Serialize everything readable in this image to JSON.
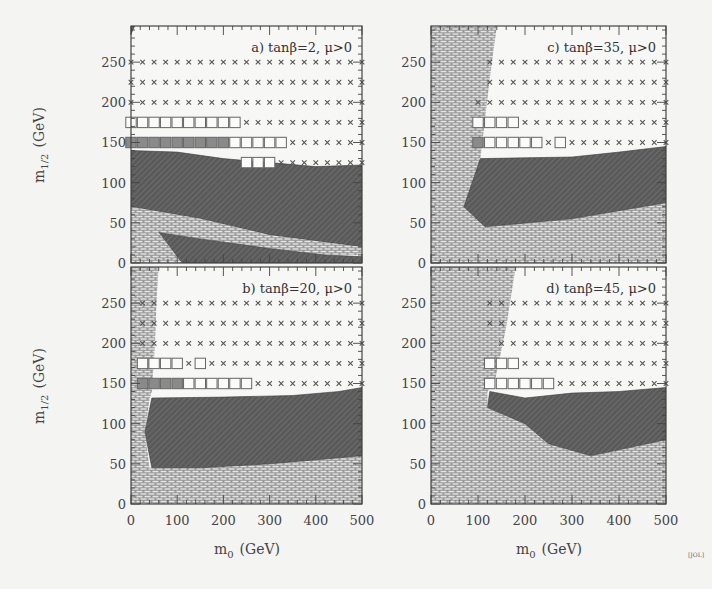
{
  "chart_data": [
    {
      "type": "scatter",
      "panel": "a",
      "title": "a) tanβ=2, μ>0",
      "xlabel": "m0 (GeV)",
      "ylabel": "m1/2 (GeV)",
      "xlim": [
        0,
        500
      ],
      "ylim": [
        0,
        295
      ],
      "xticks": [
        0,
        100,
        200,
        300,
        400,
        500
      ],
      "yticks": [
        0,
        50,
        100,
        150,
        200,
        250
      ],
      "grid_x_start": 0,
      "grid_dx": 25,
      "grid_cols": 21,
      "rows": [
        {
          "y": 250,
          "markers": "xxxxxxxxxxxxxxxxxxxxx"
        },
        {
          "y": 225,
          "markers": "xxxxxxxxxxxxxxxxxxxxx"
        },
        {
          "y": 200,
          "markers": "xxxxxxxxxxxxxxxxxxxxx"
        },
        {
          "y": 175,
          "markers": "ooooooooooxxxxxxxxxxx"
        },
        {
          "y": 150,
          "markers": "FFFFFFFFFoooooxxxxxxx"
        },
        {
          "y": 125,
          "markers": "..........oooxxxxxxxx"
        }
      ],
      "regions": [
        {
          "kind": "hatched",
          "points": [
            [
              0,
              140
            ],
            [
              100,
              138
            ],
            [
              200,
              130
            ],
            [
              300,
              125
            ],
            [
              400,
              120
            ],
            [
              500,
              122
            ],
            [
              500,
              20
            ],
            [
              300,
              35
            ],
            [
              150,
              55
            ],
            [
              0,
              70
            ]
          ]
        },
        {
          "kind": "brick",
          "points": [
            [
              0,
              70
            ],
            [
              150,
              55
            ],
            [
              300,
              35
            ],
            [
              500,
              20
            ],
            [
              500,
              10
            ],
            [
              420,
              10
            ],
            [
              300,
              18
            ],
            [
              150,
              30
            ],
            [
              60,
              38
            ],
            [
              30,
              30
            ],
            [
              30,
              0
            ],
            [
              0,
              0
            ]
          ]
        },
        {
          "kind": "hatched",
          "points": [
            [
              60,
              38
            ],
            [
              150,
              30
            ],
            [
              300,
              18
            ],
            [
              420,
              10
            ],
            [
              500,
              8
            ],
            [
              500,
              0
            ],
            [
              110,
              0
            ]
          ]
        },
        {
          "kind": "brick",
          "points": [
            [
              30,
              30
            ],
            [
              60,
              38
            ],
            [
              110,
              0
            ],
            [
              30,
              0
            ]
          ]
        },
        {
          "kind": "hatched",
          "points": [
            [
              0,
              295
            ],
            [
              8,
              295
            ],
            [
              0,
              285
            ]
          ]
        }
      ]
    },
    {
      "type": "scatter",
      "panel": "b",
      "title": "b) tanβ=20, μ>0",
      "xlabel": "m0 (GeV)",
      "ylabel": "m1/2 (GeV)",
      "xlim": [
        0,
        500
      ],
      "ylim": [
        0,
        295
      ],
      "xticks": [
        0,
        100,
        200,
        300,
        400,
        500
      ],
      "yticks": [
        0,
        50,
        100,
        150,
        200,
        250
      ],
      "grid_x_start": 25,
      "grid_dx": 25,
      "grid_cols": 20,
      "rows": [
        {
          "y": 250,
          "markers": "xxxxxxxxxxxxxxxxxxxx"
        },
        {
          "y": 225,
          "markers": "xxxxxxxxxxxxxxxxxxxx"
        },
        {
          "y": 200,
          "markers": "xxxxxxxxxxxxxxxxxxxx"
        },
        {
          "y": 175,
          "markers": "ooooxoxxxxxxxxxxxxxx"
        },
        {
          "y": 150,
          "markers": "FFFFooooooxxxxxxxxxx"
        }
      ],
      "regions": [
        {
          "kind": "brick",
          "points": [
            [
              0,
              0
            ],
            [
              0,
              295
            ],
            [
              60,
              295
            ],
            [
              55,
              250
            ],
            [
              52,
              200
            ],
            [
              45,
              140
            ],
            [
              40,
              130
            ],
            [
              30,
              90
            ],
            [
              40,
              45
            ],
            [
              500,
              60
            ],
            [
              500,
              0
            ]
          ]
        },
        {
          "kind": "hatched",
          "points": [
            [
              45,
              132
            ],
            [
              200,
              133
            ],
            [
              350,
              135
            ],
            [
              450,
              140
            ],
            [
              500,
              145
            ],
            [
              500,
              60
            ],
            [
              300,
              50
            ],
            [
              150,
              45
            ],
            [
              45,
              45
            ],
            [
              30,
              90
            ]
          ]
        }
      ]
    },
    {
      "type": "scatter",
      "panel": "c",
      "title": "c) tanβ=35, μ>0",
      "xlabel": "m0 (GeV)",
      "ylabel": "m1/2 (GeV)",
      "xlim": [
        0,
        500
      ],
      "ylim": [
        0,
        295
      ],
      "xticks": [
        0,
        100,
        200,
        300,
        400,
        500
      ],
      "yticks": [
        0,
        50,
        100,
        150,
        200,
        250
      ],
      "grid_x_start": 100,
      "grid_dx": 25,
      "grid_cols": 17,
      "rows": [
        {
          "y": 250,
          "markers": ".xxxxxxxxxxxxxxxx"
        },
        {
          "y": 225,
          "markers": ".xxxxxxxxxxxxxxxx"
        },
        {
          "y": 200,
          "markers": "xxxxxxxxxxxxxxxxx"
        },
        {
          "y": 175,
          "markers": "ooooxxxxxxxxxxxxx"
        },
        {
          "y": 150,
          "markers": "Foooooxoxxxxxxxxx"
        }
      ],
      "regions": [
        {
          "kind": "brick",
          "points": [
            [
              0,
              0
            ],
            [
              0,
              295
            ],
            [
              140,
              295
            ],
            [
              125,
              230
            ],
            [
              105,
              130
            ],
            [
              90,
              80
            ],
            [
              115,
              45
            ],
            [
              300,
              55
            ],
            [
              500,
              75
            ],
            [
              500,
              0
            ]
          ]
        },
        {
          "kind": "hatched",
          "points": [
            [
              105,
              130
            ],
            [
              300,
              132
            ],
            [
              400,
              138
            ],
            [
              500,
              145
            ],
            [
              500,
              75
            ],
            [
              300,
              55
            ],
            [
              115,
              45
            ],
            [
              70,
              70
            ]
          ]
        }
      ]
    },
    {
      "type": "scatter",
      "panel": "d",
      "title": "d) tanβ=45, μ>0",
      "xlabel": "m0 (GeV)",
      "ylabel": "m1/2 (GeV)",
      "xlim": [
        0,
        500
      ],
      "ylim": [
        0,
        295
      ],
      "xticks": [
        0,
        100,
        200,
        300,
        400,
        500
      ],
      "yticks": [
        0,
        50,
        100,
        150,
        200,
        250
      ],
      "grid_x_start": 125,
      "grid_dx": 25,
      "grid_cols": 16,
      "rows": [
        {
          "y": 250,
          "markers": "xxxxxxxxxxxxxxxx"
        },
        {
          "y": 225,
          "markers": "xxxxxxxxxxxxxxxx"
        },
        {
          "y": 200,
          "markers": ".xxxxxxxxxxxxxxx"
        },
        {
          "y": 175,
          "markers": "oooxxxxxxxxxxxxx"
        },
        {
          "y": 150,
          "markers": "ooooooxxxxxxxxxx"
        }
      ],
      "regions": [
        {
          "kind": "brick",
          "points": [
            [
              0,
              0
            ],
            [
              0,
              295
            ],
            [
              180,
              295
            ],
            [
              160,
              220
            ],
            [
              135,
              150
            ],
            [
              120,
              140
            ],
            [
              120,
              120
            ],
            [
              200,
              100
            ],
            [
              250,
              75
            ],
            [
              340,
              60
            ],
            [
              420,
              70
            ],
            [
              500,
              80
            ],
            [
              500,
              0
            ]
          ]
        },
        {
          "kind": "hatched",
          "points": [
            [
              125,
              140
            ],
            [
              200,
              132
            ],
            [
              300,
              138
            ],
            [
              400,
              140
            ],
            [
              500,
              145
            ],
            [
              500,
              80
            ],
            [
              420,
              70
            ],
            [
              340,
              60
            ],
            [
              250,
              75
            ],
            [
              200,
              100
            ],
            [
              120,
              120
            ]
          ]
        }
      ]
    }
  ],
  "labels": {
    "ylabel_main": "m",
    "ylabel_sub": "1/2",
    "ylabel_unit": "(GeV)",
    "xlabel_main": "m",
    "xlabel_sub": "0",
    "xlabel_unit": "(GeV)",
    "credit": "[JOL]"
  },
  "colors": {
    "background": "#f4f4f2",
    "hatched_fill": "#5a5a5a",
    "hatched_line": "#7c7c7c",
    "brick_fill": "#9a9a9a",
    "brick_line": "#e6e6e6",
    "frame": "#444444",
    "marker": "#555555",
    "filled_square": "#8a8a8a"
  }
}
